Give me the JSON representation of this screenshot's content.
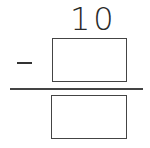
{
  "problem": {
    "operation": "subtraction",
    "minuend": "10",
    "operator_symbol": "−",
    "subtrahend_box": {
      "value": "",
      "placeholder": ""
    },
    "difference_box": {
      "value": "",
      "placeholder": ""
    }
  },
  "colors": {
    "ink": "#333333",
    "background": "#ffffff"
  }
}
